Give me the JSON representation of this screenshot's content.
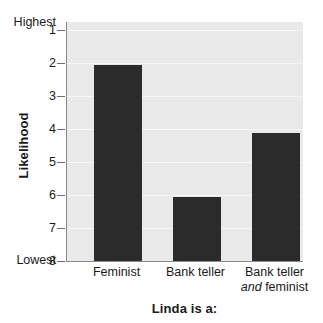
{
  "chart_data": {
    "type": "bar",
    "title": "",
    "xlabel": "Linda is a:",
    "ylabel": "Likelihood",
    "categories": [
      "Feminist",
      "Bank teller",
      "Bank teller and feminist"
    ],
    "values": [
      2.05,
      6.06,
      4.12
    ],
    "ylim": [
      1,
      8
    ],
    "y_inverted": true,
    "yticks": [
      "1",
      "2",
      "3",
      "4",
      "5",
      "6",
      "7",
      "8"
    ],
    "y_axis_extremes": {
      "top": "Highest",
      "bottom": "Lowest"
    },
    "grid": true,
    "legend": "none",
    "bar_color": "#2b2b2b",
    "plot_background": "#e9e9e9",
    "gridline_color": "#f7f7f7",
    "axis_color": "#8a8a8a",
    "category_labels": [
      {
        "line1": "Feminist",
        "line2": "",
        "line2_italic_prefix": ""
      },
      {
        "line1": "Bank teller",
        "line2": "",
        "line2_italic_prefix": ""
      },
      {
        "line1": "Bank teller",
        "line2": "feminist",
        "line2_italic_prefix": "and"
      }
    ]
  }
}
